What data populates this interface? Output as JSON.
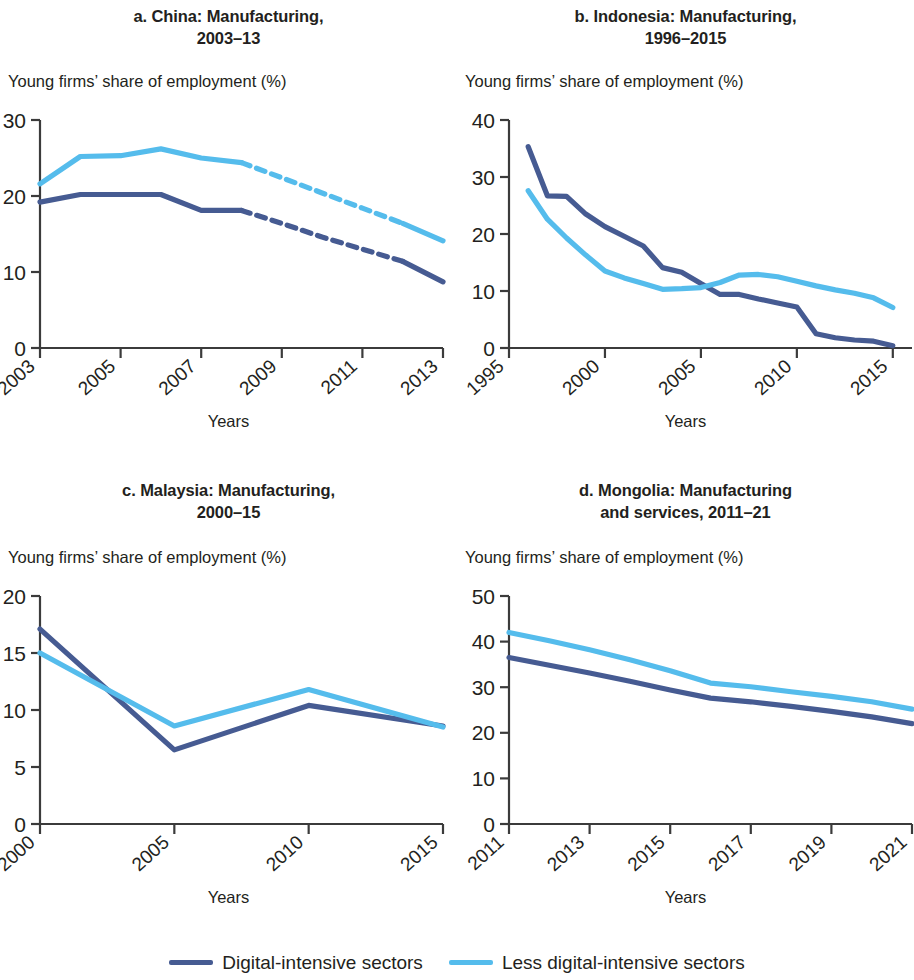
{
  "colors": {
    "digital_intensive": "#465b92",
    "less_digital_intensive": "#55bcec",
    "axis": "#3b3b3b",
    "text": "#231f20"
  },
  "legend": {
    "items": [
      {
        "label": "Digital-intensive sectors",
        "color": "#465b92"
      },
      {
        "label": "Less digital-intensive sectors",
        "color": "#55bcec"
      }
    ]
  },
  "panels": [
    {
      "key": "a",
      "title_line1": "a. China: Manufacturing,",
      "title_line2": "2003–13",
      "axis_caption": "Young firms’ share of employment (%)",
      "xlabel": "Years"
    },
    {
      "key": "b",
      "title_line1": "b. Indonesia: Manufacturing,",
      "title_line2": "1996–2015",
      "axis_caption": "Young firms’ share of employment (%)",
      "xlabel": "Years"
    },
    {
      "key": "c",
      "title_line1": "c. Malaysia: Manufacturing,",
      "title_line2": "2000–15",
      "axis_caption": "Young firms’ share of employment (%)",
      "xlabel": "Years"
    },
    {
      "key": "d",
      "title_line1": "d. Mongolia: Manufacturing",
      "title_line2": "and services, 2011–21",
      "axis_caption": "Young firms’ share of employment (%)",
      "xlabel": "Years"
    }
  ],
  "chart_data": [
    {
      "panel": "a",
      "type": "line",
      "title": "a. China: Manufacturing, 2003–13",
      "xlabel": "Years",
      "ylabel": "Young firms’ share of employment (%)",
      "xlim": [
        2003,
        2013
      ],
      "ylim": [
        0,
        30
      ],
      "yticks": [
        0,
        10,
        20,
        30
      ],
      "xticks": [
        2003,
        2005,
        2007,
        2009,
        2011,
        2013
      ],
      "grid": false,
      "legend_position": "bottom-figure",
      "x": [
        2003,
        2004,
        2005,
        2006,
        2007,
        2008,
        2009,
        2010,
        2011,
        2012,
        2013
      ],
      "series": [
        {
          "name": "Digital-intensive sectors",
          "color": "#465b92",
          "values": [
            19.2,
            20.2,
            20.2,
            20.2,
            18.1,
            18.1,
            16.4,
            14.6,
            13.0,
            11.4,
            8.7
          ],
          "dashed_from": 2008,
          "dashed_to": 2012
        },
        {
          "name": "Less digital-intensive sectors",
          "color": "#55bcec",
          "values": [
            21.6,
            25.2,
            25.3,
            26.2,
            25.0,
            24.4,
            22.4,
            20.4,
            18.4,
            16.4,
            14.1
          ],
          "dashed_from": 2008,
          "dashed_to": 2012
        }
      ]
    },
    {
      "panel": "b",
      "type": "line",
      "title": "b. Indonesia: Manufacturing, 1996–2015",
      "xlabel": "Years",
      "ylabel": "Young firms’ share of employment (%)",
      "xlim": [
        1995,
        2016
      ],
      "ylim": [
        0,
        40
      ],
      "yticks": [
        0,
        10,
        20,
        30,
        40
      ],
      "xticks": [
        1995,
        2000,
        2005,
        2010,
        2015
      ],
      "grid": false,
      "legend_position": "bottom-figure",
      "x": [
        1996,
        1997,
        1998,
        1999,
        2000,
        2001,
        2002,
        2003,
        2004,
        2005,
        2006,
        2007,
        2008,
        2009,
        2010,
        2011,
        2012,
        2013,
        2014,
        2015
      ],
      "series": [
        {
          "name": "Digital-intensive sectors",
          "color": "#465b92",
          "values": [
            35.3,
            26.7,
            26.6,
            23.5,
            21.3,
            19.6,
            17.9,
            14.1,
            13.3,
            11.3,
            9.4,
            9.4,
            8.6,
            7.9,
            7.2,
            2.5,
            1.8,
            1.4,
            1.2,
            0.4
          ],
          "dashed_from": null,
          "dashed_to": null
        },
        {
          "name": "Less digital-intensive sectors",
          "color": "#55bcec",
          "values": [
            27.6,
            22.6,
            19.3,
            16.3,
            13.5,
            12.3,
            11.3,
            10.3,
            10.4,
            10.6,
            11.5,
            12.8,
            12.9,
            12.5,
            11.7,
            10.9,
            10.2,
            9.6,
            8.8,
            7.1
          ],
          "dashed_from": null,
          "dashed_to": null
        }
      ]
    },
    {
      "panel": "c",
      "type": "line",
      "title": "c. Malaysia: Manufacturing, 2000–15",
      "xlabel": "Years",
      "ylabel": "Young firms’ share of employment (%)",
      "xlim": [
        2000,
        2015
      ],
      "ylim": [
        0,
        20
      ],
      "yticks": [
        0,
        5,
        10,
        15,
        20
      ],
      "xticks": [
        2000,
        2005,
        2010,
        2015
      ],
      "grid": false,
      "legend_position": "bottom-figure",
      "x": [
        2000,
        2005,
        2010,
        2015
      ],
      "series": [
        {
          "name": "Digital-intensive sectors",
          "color": "#465b92",
          "values": [
            17.1,
            6.5,
            10.4,
            8.6
          ],
          "dashed_from": null,
          "dashed_to": null
        },
        {
          "name": "Less digital-intensive sectors",
          "color": "#55bcec",
          "values": [
            15.0,
            8.6,
            11.8,
            8.5
          ],
          "dashed_from": null,
          "dashed_to": null
        }
      ]
    },
    {
      "panel": "d",
      "type": "line",
      "title": "d. Mongolia: Manufacturing and services, 2011–21",
      "xlabel": "Years",
      "ylabel": "Young firms’ share of employment (%)",
      "xlim": [
        2011,
        2021
      ],
      "ylim": [
        0,
        50
      ],
      "yticks": [
        0,
        10,
        20,
        30,
        40,
        50
      ],
      "xticks": [
        2011,
        2013,
        2015,
        2017,
        2019,
        2021
      ],
      "grid": false,
      "legend_position": "bottom-figure",
      "x": [
        2011,
        2012,
        2013,
        2014,
        2015,
        2016,
        2017,
        2018,
        2019,
        2020,
        2021
      ],
      "series": [
        {
          "name": "Digital-intensive sectors",
          "color": "#465b92",
          "values": [
            36.5,
            34.8,
            33.1,
            31.3,
            29.4,
            27.6,
            26.8,
            25.8,
            24.7,
            23.5,
            22.0
          ],
          "dashed_from": null,
          "dashed_to": null
        },
        {
          "name": "Less digital-intensive sectors",
          "color": "#55bcec",
          "values": [
            42.0,
            40.2,
            38.2,
            36.0,
            33.6,
            30.9,
            30.1,
            29.0,
            28.0,
            26.8,
            25.2
          ],
          "dashed_from": null,
          "dashed_to": null
        }
      ]
    }
  ]
}
